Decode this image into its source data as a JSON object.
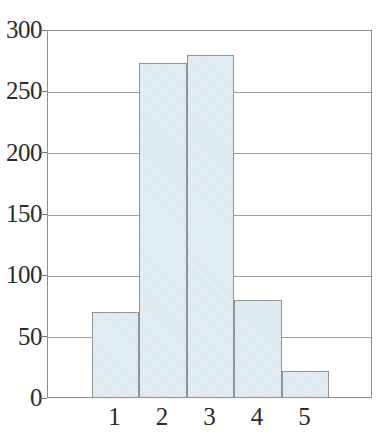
{
  "chart_data": {
    "type": "bar",
    "title": "",
    "subtitle": "",
    "xlabel": "",
    "ylabel": "",
    "categories": [
      "1",
      "2",
      "3",
      "4",
      "5"
    ],
    "values": [
      69,
      272,
      279,
      79,
      21
    ],
    "series": [
      {
        "name": "Frequency",
        "values": [
          69,
          272,
          279,
          79,
          21
        ]
      }
    ],
    "ylim": [
      0,
      300
    ],
    "yticks": [
      0,
      50,
      100,
      150,
      200,
      250,
      300
    ],
    "ytick_labels": [
      "0",
      "50",
      "100",
      "150",
      "200",
      "250",
      "300"
    ],
    "xtick_labels": [
      "1",
      "2",
      "3",
      "4",
      "5"
    ],
    "grid": "horizontal",
    "legend": "none",
    "annotations": [],
    "colors": {
      "bar_fill": "#dce9f1",
      "bar_edge": "#8f9499",
      "gridline": "#9aa0a4",
      "axis": "#8a8f93",
      "text": "#2b2b2b",
      "background": "#ffffff"
    },
    "bars_adjacent": true,
    "bar_count": 5
  }
}
